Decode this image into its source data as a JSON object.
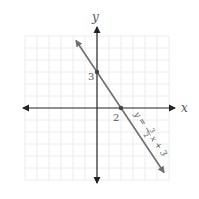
{
  "graph": {
    "axes": {
      "x_label": "x",
      "y_label": "y"
    },
    "grid": {
      "x_range": [
        -6,
        6
      ],
      "y_range": [
        -6,
        6
      ],
      "step": 1
    },
    "intercepts": [
      {
        "name": "y-intercept",
        "x": 0,
        "y": 3,
        "label": "3"
      },
      {
        "name": "x-intercept",
        "x": 2,
        "y": 0,
        "label": "2"
      }
    ],
    "line": {
      "equation": "y = −(3/2)x + 3",
      "label_parts": {
        "lhs": "y = −",
        "num": "3",
        "den": "2",
        "rhs": "x + 3"
      },
      "slope": -1.5,
      "intercept": 3
    },
    "colors": {
      "axis": "#222222",
      "line": "#6e6e6e",
      "grid": "#e8e8e8",
      "text": "#555555"
    }
  }
}
